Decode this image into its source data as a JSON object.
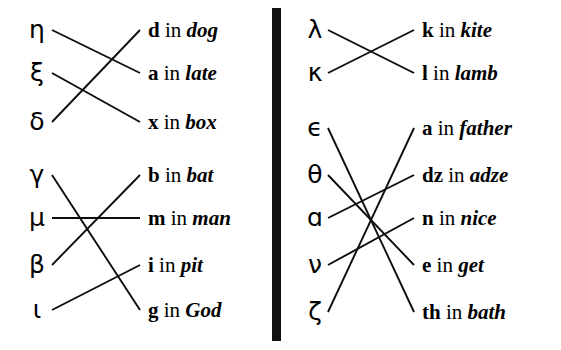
{
  "figure": {
    "divider": {
      "orientation": "vertical",
      "color": "#111111"
    }
  },
  "left_panel": {
    "groups": [
      {
        "id": "group-1",
        "greek": [
          {
            "letter": "η",
            "row": 1
          },
          {
            "letter": "ξ",
            "row": 2
          },
          {
            "letter": "δ",
            "row": 3
          }
        ],
        "glosses": [
          {
            "sym": "d",
            "in": "in",
            "word": "dog",
            "row": 1
          },
          {
            "sym": "a",
            "in": "in",
            "word": "late",
            "row": 2
          },
          {
            "sym": "x",
            "in": "in",
            "word": "box",
            "row": 3
          }
        ],
        "links": [
          {
            "from_row": 1,
            "to_row": 2
          },
          {
            "from_row": 2,
            "to_row": 3
          },
          {
            "from_row": 3,
            "to_row": 1
          }
        ]
      },
      {
        "id": "group-2",
        "greek": [
          {
            "letter": "γ",
            "row": 1
          },
          {
            "letter": "μ",
            "row": 2
          },
          {
            "letter": "β",
            "row": 3
          },
          {
            "letter": "ι",
            "row": 4
          }
        ],
        "glosses": [
          {
            "sym": "b",
            "in": "in",
            "word": "bat",
            "row": 1
          },
          {
            "sym": "m",
            "in": "in",
            "word": "man",
            "row": 2
          },
          {
            "sym": "i",
            "in": "in",
            "word": "pit",
            "row": 3
          },
          {
            "sym": "g",
            "in": "in",
            "word": "God",
            "row": 4
          }
        ],
        "links": [
          {
            "from_row": 1,
            "to_row": 4
          },
          {
            "from_row": 2,
            "to_row": 2
          },
          {
            "from_row": 3,
            "to_row": 1
          },
          {
            "from_row": 4,
            "to_row": 3
          }
        ]
      }
    ]
  },
  "right_panel": {
    "groups": [
      {
        "id": "group-3",
        "greek": [
          {
            "letter": "λ",
            "row": 1
          },
          {
            "letter": "κ",
            "row": 2
          }
        ],
        "glosses": [
          {
            "sym": "k",
            "in": "in",
            "word": "kite",
            "row": 1
          },
          {
            "sym": "l",
            "in": "in",
            "word": "lamb",
            "row": 2
          }
        ],
        "links": [
          {
            "from_row": 1,
            "to_row": 2
          },
          {
            "from_row": 2,
            "to_row": 1
          }
        ]
      },
      {
        "id": "group-4",
        "greek": [
          {
            "letter": "ϵ",
            "row": 1
          },
          {
            "letter": "θ",
            "row": 2
          },
          {
            "letter": "ɑ",
            "row": 3
          },
          {
            "letter": "ν",
            "row": 4
          },
          {
            "letter": "ζ",
            "row": 5
          }
        ],
        "glosses": [
          {
            "sym": "a",
            "in": "in",
            "word": "father",
            "row": 1
          },
          {
            "sym": "dz",
            "in": "in",
            "word": "adze",
            "row": 2
          },
          {
            "sym": "n",
            "in": "in",
            "word": "nice",
            "row": 3
          },
          {
            "sym": "e",
            "in": "in",
            "word": "get",
            "row": 4
          },
          {
            "sym": "th",
            "in": "in",
            "word": "bath",
            "row": 5
          }
        ],
        "links": [
          {
            "from_row": 1,
            "to_row": 5
          },
          {
            "from_row": 2,
            "to_row": 4
          },
          {
            "from_row": 3,
            "to_row": 2
          },
          {
            "from_row": 4,
            "to_row": 3
          },
          {
            "from_row": 5,
            "to_row": 1
          }
        ]
      }
    ]
  }
}
